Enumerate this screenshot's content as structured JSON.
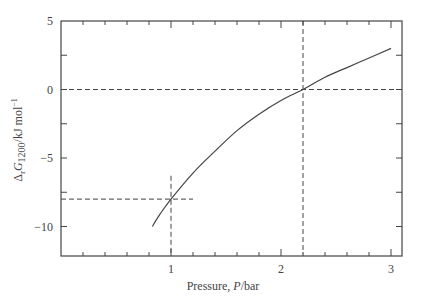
{
  "chart_data": {
    "type": "line",
    "title": "",
    "xlabel": "Pressure, P/bar",
    "xlabel_parts": {
      "pre": "Pressure, ",
      "italic": "P",
      "post": "/bar"
    },
    "ylabel": "ΔrG1200/kJ mol−1",
    "ylabel_parts": {
      "delta": "Δ",
      "sub_r": "r",
      "G": "G",
      "sub_T": "1200",
      "unit": "/kJ mol",
      "sup": "−1"
    },
    "xlim": [
      0,
      3.1
    ],
    "ylim": [
      -12,
      5
    ],
    "x_ticks": [
      1,
      2,
      3
    ],
    "x_tick_labels": [
      "1",
      "2",
      "3"
    ],
    "x_minor_step": 0.2,
    "y_ticks": [
      5,
      0,
      -5,
      -10
    ],
    "y_tick_labels": [
      "5",
      "0",
      "−5",
      "−10"
    ],
    "y_minor_step": 2.5,
    "grid": false,
    "legend": null,
    "series": [
      {
        "name": "ΔrG1200 vs P",
        "x": [
          0.83,
          0.9,
          1.0,
          1.2,
          1.4,
          1.6,
          1.8,
          2.0,
          2.2,
          2.4,
          2.6,
          2.8,
          3.0
        ],
        "y": [
          -10.0,
          -9.1,
          -8.0,
          -6.1,
          -4.5,
          -3.0,
          -1.8,
          -0.8,
          0.0,
          0.9,
          1.6,
          2.3,
          3.0
        ]
      }
    ],
    "annotations": [
      {
        "type": "hline-dashed",
        "y": 0,
        "x_from": 0,
        "x_to": 3.1
      },
      {
        "type": "vline-dashed",
        "x": 2.2,
        "y_from": -12,
        "y_to": 5
      },
      {
        "type": "hline-dashed",
        "y": -8,
        "x_from": 0,
        "x_to": 1.2
      },
      {
        "type": "vline-dashed",
        "x": 1.0,
        "y_from": -12,
        "y_to": -6.3
      }
    ]
  }
}
